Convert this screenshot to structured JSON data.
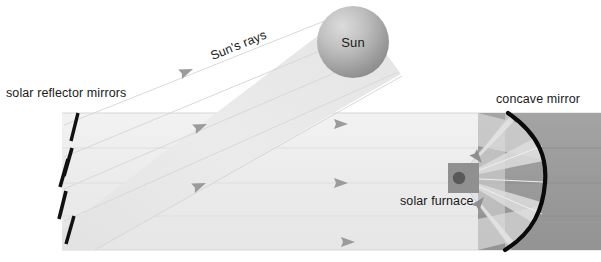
{
  "diagram": {
    "background_color": "#ffffff",
    "width": 601,
    "height": 262,
    "labels": {
      "sun": "Sun",
      "suns_rays": "Sun's rays",
      "solar_reflector_mirrors": "solar reflector mirrors",
      "concave_mirror": "concave mirror",
      "solar_furnace": "solar furnace"
    },
    "colors": {
      "beam_incoming": "#e9e9e9",
      "beam_reflected": "#efefef",
      "ray_line": "#d2d2d2",
      "arrow_head": "#9b9b9b",
      "sun_light": "#d9d9d9",
      "sun_dark": "#8f8f8f",
      "mirror_bar": "#111111",
      "concave_mirror_stroke": "#0a0a0a",
      "block_gray": "#9e9e9e",
      "block_gray_dark": "#8a8a8a",
      "furnace_box": "#8e8e8e",
      "furnace_focus": "#5a5a5a",
      "text": "#1a1a1a"
    },
    "components": {
      "mirror_count": 5,
      "mirror_bars": [
        {
          "x1": 78,
          "y1": 113,
          "x2": 71,
          "y2": 141
        },
        {
          "x1": 72,
          "y1": 148,
          "x2": 64,
          "y2": 176
        },
        {
          "x1": 68,
          "y1": 159,
          "x2": 60,
          "y2": 187
        },
        {
          "x1": 66,
          "y1": 191,
          "x2": 59,
          "y2": 219
        },
        {
          "x1": 74,
          "y1": 216,
          "x2": 66,
          "y2": 244
        }
      ],
      "sun": {
        "cx": 353,
        "cy": 42,
        "r": 36
      },
      "furnace_box": {
        "x": 448,
        "y": 163,
        "width": 31,
        "height": 30
      },
      "furnace_focus": {
        "cx": 459,
        "cy": 178,
        "r": 6
      },
      "concave_mirror_arc": {
        "top_x": 508,
        "top_y": 113,
        "apex_x": 545,
        "apex_y": 182,
        "bottom_x": 505,
        "bottom_y": 250
      },
      "gray_block": {
        "x": 478,
        "y": 113,
        "width": 123,
        "height": 137
      },
      "incoming_beam_angle_deg": -22,
      "reflected_beam": {
        "top_y": 113,
        "bottom_y": 250,
        "left_x": 62,
        "right_x": 601
      },
      "arrow_positions": {
        "diagonal": [
          {
            "x": 193,
            "y": 69
          },
          {
            "x": 203,
            "y": 124
          },
          {
            "x": 200,
            "y": 183
          }
        ],
        "horizontal": [
          {
            "x": 336,
            "y": 124
          },
          {
            "x": 336,
            "y": 183
          },
          {
            "x": 343,
            "y": 242
          }
        ],
        "furnace_converging": [
          {
            "x": 489,
            "y": 160
          },
          {
            "x": 492,
            "y": 203
          }
        ]
      }
    }
  }
}
